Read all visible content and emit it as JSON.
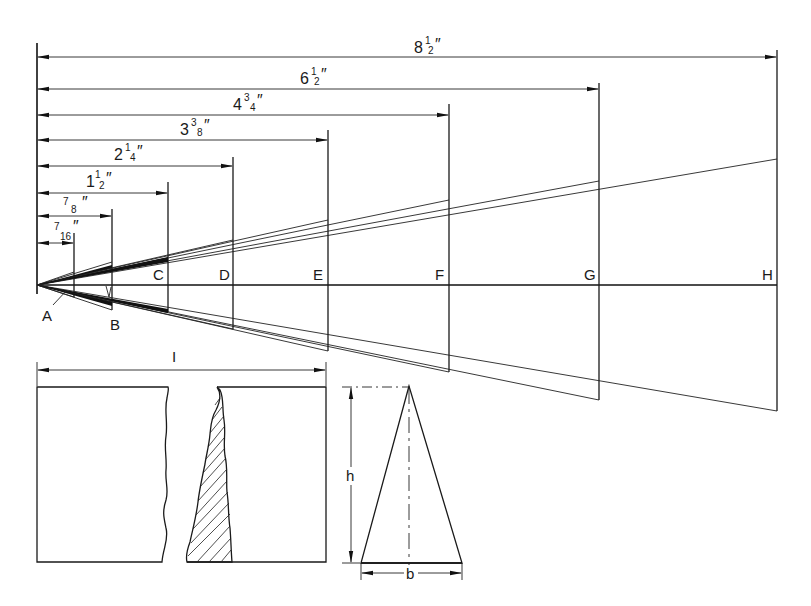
{
  "dimensions": [
    {
      "id": "d8",
      "whole": "8",
      "num": "1",
      "den": "2",
      "inches": "″",
      "label": "8½″",
      "value_in": 8.5
    },
    {
      "id": "d6",
      "whole": "6",
      "num": "1",
      "den": "2",
      "inches": "″",
      "label": "6½″",
      "value_in": 6.5
    },
    {
      "id": "d4",
      "whole": "4",
      "num": "3",
      "den": "4",
      "inches": "″",
      "label": "4¾″",
      "value_in": 4.75
    },
    {
      "id": "d3",
      "whole": "3",
      "num": "3",
      "den": "8",
      "inches": "″",
      "label": "3⅜″",
      "value_in": 3.375
    },
    {
      "id": "d2",
      "whole": "2",
      "num": "1",
      "den": "4",
      "inches": "″",
      "label": "2¼″",
      "value_in": 2.25
    },
    {
      "id": "d1",
      "whole": "1",
      "num": "1",
      "den": "2",
      "inches": "″",
      "label": "1½″",
      "value_in": 1.5
    },
    {
      "id": "d78",
      "whole": "",
      "num": "7",
      "den": "8",
      "inches": "″",
      "label": "7/8″",
      "value_in": 0.875
    },
    {
      "id": "d716",
      "whole": "",
      "num": "7",
      "den": "16",
      "inches": "″",
      "label": "7/16″",
      "value_in": 0.4375
    }
  ],
  "points": {
    "A": "A",
    "B": "B",
    "C": "C",
    "D": "D",
    "E": "E",
    "F": "F",
    "G": "G",
    "H": "H"
  },
  "section": {
    "width_label": "I"
  },
  "triangle": {
    "height_label": "h",
    "base_label": "b"
  },
  "colors": {
    "ink": "#1a1a1a",
    "paper": "#ffffff"
  }
}
